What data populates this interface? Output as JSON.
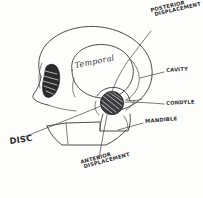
{
  "figure": {
    "kind": "hand-drawn-anatomical-sketch",
    "background_color": "#fdfdfb",
    "ink_color": "#3a3a3c"
  },
  "labels": {
    "posterior_displacement": {
      "line1": "Posterior",
      "line2": "Displacement"
    },
    "anterior_displacement": {
      "line1": "Anterior",
      "line2": "Displacement"
    },
    "cavity": "Cavity",
    "condyle": "Condyle",
    "mandible": "Mandible",
    "disc": "Disc",
    "temporal": "Temporal"
  },
  "structures": [
    {
      "name": "cranium-outline",
      "description": "large rounded skull vault seen from the side"
    },
    {
      "name": "temporal-bone-region",
      "description": "inner rounded outline enclosing the word Temporal"
    },
    {
      "name": "orbit-marking",
      "description": "dark hatched almond shape at the front of the skull"
    },
    {
      "name": "condyle-head",
      "description": "dark hatched circular condyle at the joint"
    },
    {
      "name": "mandible-outline",
      "description": "angular jaw body and ramus beneath the skull"
    },
    {
      "name": "zygomatic-arch",
      "description": "thin arch running forward from the joint"
    }
  ],
  "leaders": [
    {
      "from": "posterior_displacement",
      "to": "condyle-head"
    },
    {
      "from": "cavity",
      "to": "temporal-bone-region"
    },
    {
      "from": "condyle",
      "to": "condyle-head"
    },
    {
      "from": "mandible",
      "to": "mandible-outline"
    },
    {
      "from": "disc",
      "to": "condyle-head"
    },
    {
      "from": "anterior_displacement",
      "to": "condyle-head"
    }
  ]
}
